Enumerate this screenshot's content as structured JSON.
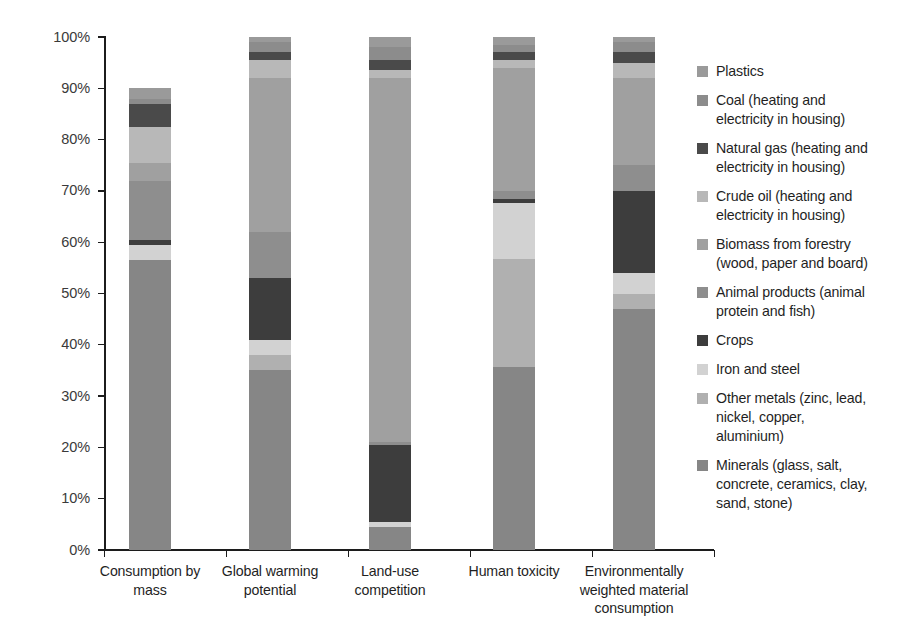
{
  "chart_data": {
    "type": "bar",
    "subtype": "stacked-100-percent",
    "title": "",
    "xlabel": "",
    "ylabel": "",
    "ylim": [
      0,
      100
    ],
    "y_unit": "%",
    "grid": false,
    "legend_position": "right",
    "categories": [
      "Consumption by\nmass",
      "Global warming\npotential",
      "Land-use\ncompetition",
      "Human toxicity",
      "Environmentally\nweighted material\nconsumption"
    ],
    "y_ticks": [
      "0%",
      "10%",
      "20%",
      "30%",
      "40%",
      "50%",
      "60%",
      "70%",
      "80%",
      "90%",
      "100%"
    ],
    "y_tick_values": [
      0,
      10,
      20,
      30,
      40,
      50,
      60,
      70,
      80,
      90,
      100
    ],
    "series": [
      {
        "name": "Plastics",
        "color": "#9a9a9a",
        "values": [
          2.0,
          1.0,
          2.0,
          1.5,
          1.0
        ]
      },
      {
        "name": "Coal (heating and electricity in housing)",
        "color": "#8c8c8c",
        "values": [
          1.0,
          2.0,
          2.5,
          1.5,
          2.0
        ]
      },
      {
        "name": "Natural gas (heating and electricity in housing)",
        "color": "#4a4a4a",
        "values": [
          4.5,
          1.5,
          2.0,
          1.5,
          2.0
        ]
      },
      {
        "name": "Crude oil (heating and electricity in housing)",
        "color": "#b8b8b8",
        "values": [
          7.0,
          3.5,
          1.5,
          1.5,
          3.0
        ]
      },
      {
        "name": "Biomass from forestry (wood, paper and board)",
        "color": "#a0a0a0",
        "values": [
          3.5,
          30.0,
          71.0,
          24.0,
          17.0
        ]
      },
      {
        "name": "Animal products (animal protein and fish)",
        "color": "#8e8e8e",
        "values": [
          11.5,
          9.0,
          0.5,
          1.5,
          5.0
        ]
      },
      {
        "name": "Crops",
        "color": "#3d3d3d",
        "values": [
          1.0,
          12.0,
          15.0,
          0.8,
          16.0
        ]
      },
      {
        "name": "Iron and steel",
        "color": "#d2d2d2",
        "values": [
          3.0,
          3.0,
          1.0,
          11.0,
          4.0
        ]
      },
      {
        "name": "Other metals (zinc, lead, nickel, copper, aluminium)",
        "color": "#b0b0b0",
        "values": [
          0.0,
          3.0,
          0.0,
          21.0,
          3.0
        ]
      },
      {
        "name": "Minerals (glass, salt, concrete, ceramics, clay, sand, stone)",
        "color": "#868686",
        "values": [
          56.5,
          35.0,
          4.5,
          35.7,
          47.0
        ]
      }
    ]
  },
  "legend": {
    "items": [
      {
        "label": "Plastics",
        "color": "#9a9a9a"
      },
      {
        "label": "Coal (heating and\nelectricity in housing)",
        "color": "#8c8c8c"
      },
      {
        "label": "Natural gas (heating and\nelectricity in housing)",
        "color": "#4a4a4a"
      },
      {
        "label": "Crude oil (heating and\nelectricity in housing)",
        "color": "#b8b8b8"
      },
      {
        "label": "Biomass from forestry\n(wood, paper and board)",
        "color": "#a0a0a0"
      },
      {
        "label": "Animal products (animal\nprotein and fish)",
        "color": "#8e8e8e"
      },
      {
        "label": "Crops",
        "color": "#3d3d3d"
      },
      {
        "label": "Iron and steel",
        "color": "#d2d2d2"
      },
      {
        "label": "Other metals (zinc, lead,\nnickel, copper,\naluminium)",
        "color": "#b0b0b0"
      },
      {
        "label": "Minerals (glass, salt,\nconcrete, ceramics, clay,\nsand, stone)",
        "color": "#868686"
      }
    ]
  }
}
